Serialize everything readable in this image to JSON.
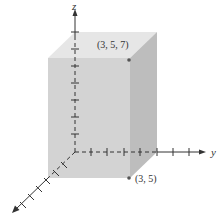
{
  "figure": {
    "type": "3d-rectangular-box",
    "axes": {
      "x": {
        "label": "",
        "ticks": 6
      },
      "y": {
        "label": "y",
        "ticks": 7
      },
      "z": {
        "label": "z",
        "ticks": 8
      }
    },
    "points": [
      {
        "label": "(3, 5, 7)",
        "coords": [
          3,
          5,
          7
        ]
      },
      {
        "label": "(3, 5)",
        "coords": [
          3,
          5,
          0
        ]
      }
    ],
    "colors": {
      "front_face": "#d3d3d3",
      "top_face": "#e6e6e6",
      "right_face": "#bdbdbd",
      "axis": "#333333",
      "point": "#555555"
    }
  }
}
